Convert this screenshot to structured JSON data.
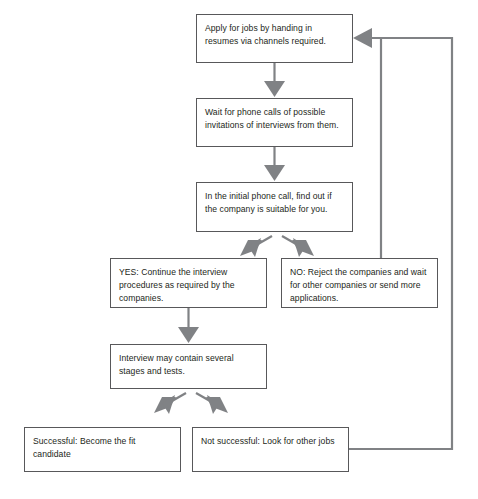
{
  "diagram": {
    "colors": {
      "box_border": "#58585a",
      "arrow_fill": "#808285",
      "line": "#808285",
      "text": "#231f20",
      "background": "#ffffff"
    },
    "nodes": [
      {
        "id": "apply",
        "text": "Apply for jobs by handing in resumes via channels required."
      },
      {
        "id": "wait",
        "text": "Wait for phone calls of possible invitations  of interviews from them."
      },
      {
        "id": "initial",
        "text": "In the initial phone call, find out if the company is suitable for you."
      },
      {
        "id": "yes",
        "text": "YES: Continue the interview procedures as required by the companies."
      },
      {
        "id": "no",
        "text": "NO: Reject the companies and wait for other companies or send more applications."
      },
      {
        "id": "interview",
        "text": "Interview may contain several stages and tests."
      },
      {
        "id": "success",
        "text": "Successful: Become the fit candidate"
      },
      {
        "id": "notsuccess",
        "text": "Not successful: Look for other jobs"
      }
    ],
    "connectors": [
      {
        "id": "apply-to-wait",
        "kind": "down-arrow"
      },
      {
        "id": "wait-to-initial",
        "kind": "down-arrow"
      },
      {
        "id": "initial-to-yes",
        "kind": "diagonal-arrow-left"
      },
      {
        "id": "initial-to-no",
        "kind": "diagonal-arrow-right"
      },
      {
        "id": "yes-to-interview",
        "kind": "down-arrow"
      },
      {
        "id": "interview-to-success",
        "kind": "diagonal-arrow-left"
      },
      {
        "id": "interview-to-notsuccess",
        "kind": "diagonal-arrow-right"
      },
      {
        "id": "no-loopback-to-apply",
        "kind": "feedback-line"
      },
      {
        "id": "notsuccess-loopback-to-apply",
        "kind": "feedback-line"
      }
    ]
  }
}
